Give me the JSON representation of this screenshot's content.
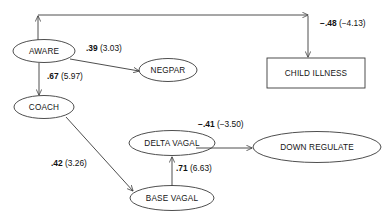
{
  "diagram": {
    "stroke_color": "#3a3a3a",
    "text_color": "#141414",
    "background": "#ffffff",
    "nodes": [
      {
        "id": "aware",
        "label": "AWARE",
        "shape": "ellipse",
        "cx": 44,
        "cy": 51,
        "rx": 31,
        "ry": 11.5
      },
      {
        "id": "coach",
        "label": "COACH",
        "shape": "ellipse",
        "cx": 44,
        "cy": 107,
        "rx": 30,
        "ry": 11.5
      },
      {
        "id": "negpar",
        "label": "NEGPAR",
        "shape": "ellipse",
        "cx": 168,
        "cy": 70,
        "rx": 29,
        "ry": 11.5
      },
      {
        "id": "child_illness",
        "label": "CHILD ILLNESS",
        "shape": "rectangle",
        "x": 267,
        "y": 58,
        "w": 98,
        "h": 30
      },
      {
        "id": "delta_vagal",
        "label": "DELTA VAGAL",
        "shape": "ellipse",
        "cx": 172,
        "cy": 143,
        "rx": 43,
        "ry": 12.5
      },
      {
        "id": "base_vagal",
        "label": "BASE VAGAL",
        "shape": "ellipse",
        "cx": 172,
        "cy": 198,
        "rx": 42,
        "ry": 12.5
      },
      {
        "id": "down_regulate",
        "label": "DOWN REGULATE",
        "shape": "ellipse",
        "cx": 317,
        "cy": 147,
        "rx": 64,
        "ry": 15.5
      }
    ],
    "paths": [
      {
        "id": "aware-to-negpar",
        "from": "aware",
        "to": "negpar",
        "estimate": ".39",
        "t_value": "(3.03)",
        "label_x": 86,
        "label_y": 43
      },
      {
        "id": "aware-to-coach",
        "from": "aware",
        "to": "coach",
        "estimate": ".67",
        "t_value": "(5.97)",
        "label_x": 47,
        "label_y": 71
      },
      {
        "id": "aware-to-child-illness",
        "from": "aware",
        "to": "child_illness",
        "estimate": "−.48",
        "t_value": "(−4.13)",
        "label_x": 320,
        "label_y": 18
      },
      {
        "id": "coach-to-base-vagal",
        "from": "coach",
        "to": "base_vagal",
        "estimate": ".42",
        "t_value": "(3.26)",
        "label_x": 51,
        "label_y": 158
      },
      {
        "id": "base-vagal-to-delta-vagal",
        "from": "base_vagal",
        "to": "delta_vagal",
        "estimate": ".71",
        "t_value": "(6.63)",
        "label_x": 176,
        "label_y": 163
      },
      {
        "id": "delta-vagal-to-down-regulate",
        "from": "delta_vagal",
        "to": "down_regulate",
        "estimate": "−.41",
        "t_value": "(−3.50)",
        "label_x": 198,
        "label_y": 119
      }
    ]
  }
}
